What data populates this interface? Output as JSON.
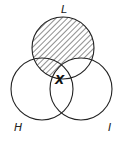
{
  "diagram": {
    "type": "venn",
    "sets": [
      {
        "id": "L",
        "label": "L",
        "position": "top"
      },
      {
        "id": "H",
        "label": "H",
        "position": "bottom-left"
      },
      {
        "id": "I",
        "label": "I",
        "position": "bottom-right"
      }
    ],
    "shaded_region": "L minus I",
    "marker": {
      "label": "X",
      "region": "L ∩ H ∩ I"
    },
    "colors": {
      "stroke": "#222222",
      "hatch": "#333333",
      "background": "#ffffff"
    }
  }
}
